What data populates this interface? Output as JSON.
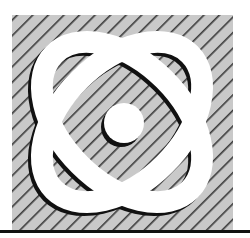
{
  "figure": {
    "colors": {
      "background": "#ffffff",
      "hatch_fill": "#c9c9c9",
      "hatch_line": "#3a3a3a",
      "ring": "#ffffff",
      "shadow": "#111111",
      "rule": "#111111"
    },
    "elements": [
      "hatched-square",
      "ring-left",
      "ring-right",
      "center-dot",
      "bottom-rule"
    ]
  }
}
